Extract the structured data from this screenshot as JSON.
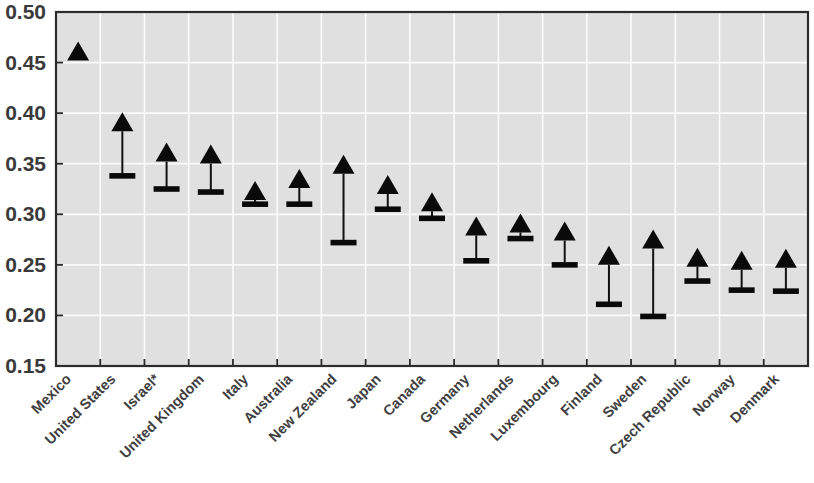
{
  "chart_data": {
    "type": "scatter",
    "title": "",
    "subtitle": "",
    "xlabel": "",
    "ylabel": "",
    "ylim": [
      0.15,
      0.5
    ],
    "ytick_step": 0.05,
    "ytick_labels": [
      "0.50",
      "0.45",
      "0.40",
      "0.35",
      "0.30",
      "0.25",
      "0.20",
      "0.15"
    ],
    "ytick_values": [
      0.5,
      0.45,
      0.4,
      0.35,
      0.3,
      0.25,
      0.2,
      0.15
    ],
    "grid": "horizontal-and-vertical",
    "legend_position": "none",
    "marker_style": "filled-triangle-up-with-stem-and-lower-cap",
    "categories": [
      "Mexico",
      "United States",
      "Israel*",
      "United Kingdom",
      "Italy",
      "Australia",
      "New Zealand",
      "Japan",
      "Canada",
      "Germany",
      "Netherlands",
      "Luxembourg",
      "Finland",
      "Sweden",
      "Czech Republic",
      "Norway",
      "Denmark"
    ],
    "series": [
      {
        "name": "upper",
        "values": [
          0.46,
          0.39,
          0.36,
          0.358,
          0.322,
          0.334,
          0.348,
          0.328,
          0.311,
          0.287,
          0.29,
          0.282,
          0.258,
          0.274,
          0.256,
          0.253,
          0.255
        ]
      },
      {
        "name": "lower",
        "values": [
          0.46,
          0.338,
          0.325,
          0.322,
          0.31,
          0.31,
          0.272,
          0.305,
          0.296,
          0.254,
          0.276,
          0.25,
          0.211,
          0.199,
          0.234,
          0.225,
          0.224
        ]
      }
    ],
    "colors": {
      "marker": "#0a0a0a",
      "plot_background": "#e0e0e0",
      "gridline": "#fbfbfb",
      "axis": "#2b2b2b",
      "text": "#3a3a3a"
    }
  },
  "geometry": {
    "plot_left": 56,
    "plot_right": 808,
    "plot_top": 12,
    "plot_bottom": 366,
    "label_rotation_deg": -45
  }
}
